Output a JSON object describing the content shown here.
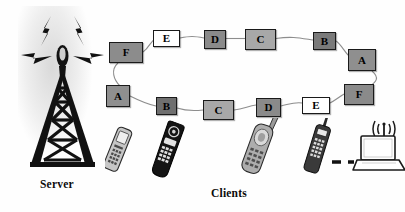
{
  "diagram": {
    "background_color": "#fefefe"
  },
  "server": {
    "label": "Server",
    "icon": "radio-tower-icon",
    "signal_icon": "lightning-signal-icon",
    "signal_count": 4
  },
  "clients": {
    "label": "Clients",
    "devices": [
      {
        "name": "mobile-phone-silver",
        "icon": "mobile-phone-icon",
        "color": "#b9b9b9"
      },
      {
        "name": "mobile-phone-black-flip",
        "icon": "flip-phone-icon",
        "color": "#151515"
      },
      {
        "name": "mobile-phone-gray-antenna",
        "icon": "mobile-phone-antenna-icon",
        "color": "#8f8f8f"
      },
      {
        "name": "mobile-phone-dark-bar",
        "icon": "bar-phone-icon",
        "color": "#2a2a2a"
      },
      {
        "name": "laptop-wireless",
        "icon": "laptop-wifi-icon",
        "color": "#ffffff"
      }
    ],
    "link_style": "dashed"
  },
  "ring": {
    "top_nodes": [
      {
        "label": "F",
        "fill": "#8c8c8c",
        "x": 109,
        "y": 42,
        "w": 34,
        "h": 21
      },
      {
        "label": "E",
        "fill": "#ffffff",
        "x": 153,
        "y": 30,
        "w": 27,
        "h": 17
      },
      {
        "label": "D",
        "fill": "#8a8a8a",
        "x": 204,
        "y": 30,
        "w": 22,
        "h": 19
      },
      {
        "label": "C",
        "fill": "#a8a8a8",
        "x": 245,
        "y": 29,
        "w": 31,
        "h": 21
      },
      {
        "label": "B",
        "fill": "#7a7a7a",
        "x": 313,
        "y": 32,
        "w": 23,
        "h": 18
      },
      {
        "label": "A",
        "fill": "#8f8f8f",
        "x": 348,
        "y": 49,
        "w": 28,
        "h": 22
      }
    ],
    "bottom_nodes": [
      {
        "label": "A",
        "fill": "#8f8f8f",
        "x": 106,
        "y": 85,
        "w": 24,
        "h": 22
      },
      {
        "label": "B",
        "fill": "#6f6f6f",
        "x": 156,
        "y": 97,
        "w": 21,
        "h": 18
      },
      {
        "label": "C",
        "fill": "#a8a8a8",
        "x": 203,
        "y": 100,
        "w": 31,
        "h": 20
      },
      {
        "label": "D",
        "fill": "#8a8a8a",
        "x": 256,
        "y": 98,
        "w": 25,
        "h": 19
      },
      {
        "label": "E",
        "fill": "#ffffff",
        "x": 302,
        "y": 97,
        "w": 28,
        "h": 17
      },
      {
        "label": "F",
        "fill": "#8a8a8a",
        "x": 344,
        "y": 84,
        "w": 30,
        "h": 21
      }
    ],
    "link_color": "#8a8a8a"
  }
}
